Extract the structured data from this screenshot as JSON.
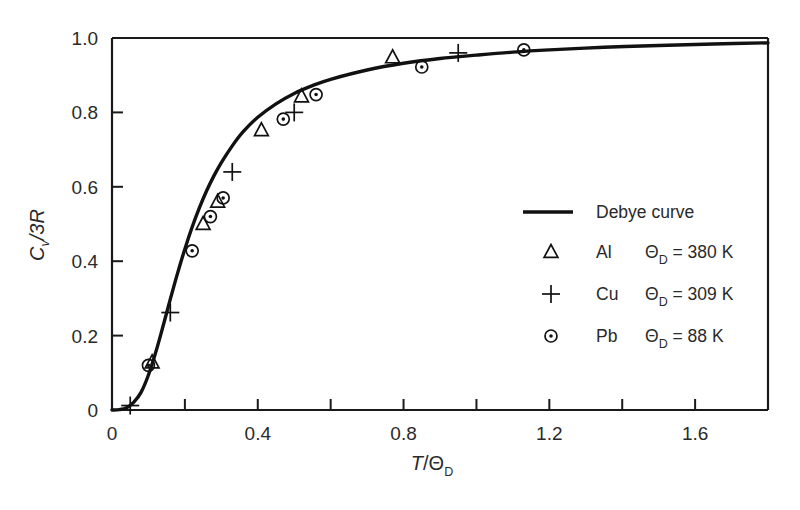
{
  "chart_data": {
    "type": "line",
    "title": "",
    "xlabel": "T/Θ_D",
    "ylabel": "C_v/3R",
    "xlim": [
      0,
      1.8
    ],
    "ylim": [
      0,
      1.0
    ],
    "grid": false,
    "legend_position": "center-right",
    "x_ticks_major": [
      "0",
      "0.4",
      "0.8",
      "1.2",
      "1.6"
    ],
    "x_ticks_major_values": [
      0,
      0.4,
      0.8,
      1.2,
      1.6
    ],
    "x_ticks_minor_values": [
      0.2,
      0.6,
      1.0,
      1.4,
      1.8
    ],
    "y_ticks": [
      "0",
      "0.2",
      "0.4",
      "0.6",
      "0.8",
      "1.0"
    ],
    "y_ticks_values": [
      0,
      0.2,
      0.4,
      0.6,
      0.8,
      1.0
    ],
    "series": [
      {
        "name": "Debye curve",
        "marker": "line",
        "points": [
          [
            0.0,
            0.0
          ],
          [
            0.02,
            0.001
          ],
          [
            0.04,
            0.006
          ],
          [
            0.06,
            0.021
          ],
          [
            0.08,
            0.048
          ],
          [
            0.1,
            0.094
          ],
          [
            0.12,
            0.155
          ],
          [
            0.14,
            0.225
          ],
          [
            0.16,
            0.298
          ],
          [
            0.18,
            0.368
          ],
          [
            0.2,
            0.433
          ],
          [
            0.22,
            0.492
          ],
          [
            0.24,
            0.544
          ],
          [
            0.26,
            0.59
          ],
          [
            0.28,
            0.63
          ],
          [
            0.3,
            0.665
          ],
          [
            0.33,
            0.71
          ],
          [
            0.36,
            0.748
          ],
          [
            0.4,
            0.787
          ],
          [
            0.45,
            0.823
          ],
          [
            0.5,
            0.851
          ],
          [
            0.55,
            0.872
          ],
          [
            0.6,
            0.889
          ],
          [
            0.7,
            0.914
          ],
          [
            0.8,
            0.932
          ],
          [
            0.9,
            0.945
          ],
          [
            1.0,
            0.954
          ],
          [
            1.1,
            0.962
          ],
          [
            1.2,
            0.968
          ],
          [
            1.35,
            0.975
          ],
          [
            1.5,
            0.98
          ],
          [
            1.65,
            0.984
          ],
          [
            1.8,
            0.987
          ]
        ]
      },
      {
        "name": "Al",
        "marker": "triangle",
        "theta_d": "380 K",
        "theta_d_value": 380,
        "points": [
          [
            0.11,
            0.128
          ],
          [
            0.25,
            0.5
          ],
          [
            0.29,
            0.56
          ],
          [
            0.41,
            0.752
          ],
          [
            0.52,
            0.843
          ],
          [
            0.77,
            0.948
          ]
        ]
      },
      {
        "name": "Cu",
        "marker": "plus",
        "theta_d": "309 K",
        "theta_d_value": 309,
        "points": [
          [
            0.05,
            0.012
          ],
          [
            0.16,
            0.262
          ],
          [
            0.33,
            0.64
          ],
          [
            0.5,
            0.8
          ],
          [
            0.95,
            0.96
          ]
        ]
      },
      {
        "name": "Pb",
        "marker": "circle-dot",
        "theta_d": "88 K",
        "theta_d_value": 88,
        "points": [
          [
            0.1,
            0.12
          ],
          [
            0.22,
            0.428
          ],
          [
            0.27,
            0.52
          ],
          [
            0.305,
            0.57
          ],
          [
            0.47,
            0.782
          ],
          [
            0.56,
            0.848
          ],
          [
            0.85,
            0.922
          ],
          [
            1.13,
            0.968
          ]
        ]
      }
    ]
  },
  "axis": {
    "y_label_numerator": "C",
    "y_label_sub": "v",
    "y_label_denominator": "/3R",
    "x_label_numerator": "T",
    "x_label_slash": "/",
    "x_label_theta": "Θ",
    "x_label_sub": "D"
  },
  "legend": {
    "curve_label": "Debye curve",
    "entries": [
      {
        "symbol": "triangle",
        "element": "Al",
        "theta": "Θ",
        "sub": "D",
        "eq": "=",
        "value": "380 K"
      },
      {
        "symbol": "plus",
        "element": "Cu",
        "theta": "Θ",
        "sub": "D",
        "eq": "=",
        "value": "309 K"
      },
      {
        "symbol": "circle-dot",
        "element": "Pb",
        "theta": "Θ",
        "sub": "D",
        "eq": "=",
        "value": "88 K"
      }
    ]
  },
  "colors": {
    "ink": "#111111",
    "text": "#2a2a2a",
    "background": "#ffffff"
  }
}
